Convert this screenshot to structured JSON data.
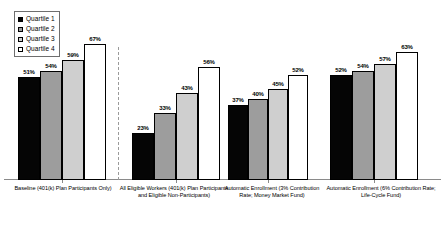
{
  "chart_data": {
    "type": "bar",
    "title": "",
    "subtitle": "",
    "xlabel": "",
    "ylabel": "",
    "ylim": [
      0,
      75
    ],
    "grid": false,
    "legend_position": "top-left",
    "value_suffix": "%",
    "categories": [
      "Baseline (401(k) Plan Participants Only)",
      "All Eligible Workers (401(k) Plan Participants and Eligible Non-Participants)",
      "Automatic Enrollment (3% Contribution Rate; Money Market Fund)",
      "Automatic Enrollment (6% Contribution Rate; Life-Cycle Fund)"
    ],
    "series": [
      {
        "name": "Quartile 1",
        "color": "#050505",
        "values": [
          51,
          23,
          37,
          52
        ]
      },
      {
        "name": "Quartile 2",
        "color": "#9d9d9d",
        "values": [
          54,
          33,
          40,
          54
        ]
      },
      {
        "name": "Quartile 3",
        "color": "#cfcfcf",
        "values": [
          59,
          43,
          45,
          57
        ]
      },
      {
        "name": "Quartile 4",
        "color": "#ffffff",
        "values": [
          67,
          56,
          52,
          63
        ]
      }
    ],
    "annotations": [
      {
        "type": "vertical-dashed-separator",
        "after_category_index": 0
      }
    ],
    "data_labels": [
      [
        "51%",
        "54%",
        "59%",
        "67%"
      ],
      [
        "23%",
        "33%",
        "43%",
        "56%"
      ],
      [
        "37%",
        "40%",
        "45%",
        "52%"
      ],
      [
        "52%",
        "54%",
        "57%",
        "63%"
      ]
    ]
  },
  "legend": {
    "items": [
      {
        "label": "Quartile 1",
        "swatch": "#050505"
      },
      {
        "label": "Quartile 2",
        "swatch": "#9d9d9d"
      },
      {
        "label": "Quartile 3",
        "swatch": "#cfcfcf"
      },
      {
        "label": "Quartile 4",
        "swatch": "#ffffff"
      }
    ]
  }
}
